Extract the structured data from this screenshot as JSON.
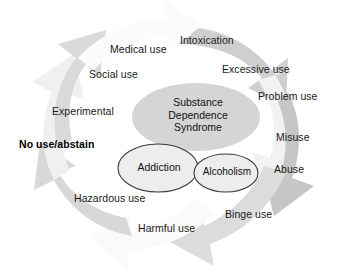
{
  "diagram": {
    "center": {
      "line1": "Substance",
      "line2": "Dependence",
      "line3": "Syndrome"
    },
    "inner_circles": [
      {
        "id": "addiction",
        "label": "Addiction"
      },
      {
        "id": "alcoholism",
        "label": "Alcoholism"
      }
    ],
    "ring_labels": [
      {
        "id": "intoxication",
        "label": "Intoxication",
        "bold": false
      },
      {
        "id": "excessive-use",
        "label": "Excessive use",
        "bold": false
      },
      {
        "id": "problem-use",
        "label": "Problem use",
        "bold": false
      },
      {
        "id": "misuse",
        "label": "Misuse",
        "bold": false
      },
      {
        "id": "abuse",
        "label": "Abuse",
        "bold": false
      },
      {
        "id": "binge-use",
        "label": "Binge use",
        "bold": false
      },
      {
        "id": "harmful-use",
        "label": "Harmful use",
        "bold": false
      },
      {
        "id": "hazardous-use",
        "label": "Hazardous use",
        "bold": false
      },
      {
        "id": "no-use-abstain",
        "label": "No use/abstain",
        "bold": true
      },
      {
        "id": "experimental",
        "label": "Experimental",
        "bold": false
      },
      {
        "id": "social-use",
        "label": "Social use",
        "bold": false
      },
      {
        "id": "medical-use",
        "label": "Medical use",
        "bold": false
      }
    ],
    "colors": {
      "background": "#ffffff",
      "arrow_light": "#f4f4f4",
      "arrow_mid": "#e2e2e2",
      "arrow_dark": "#cfcfcf",
      "arrow_darker": "#c0c0c0",
      "center_ellipse": "#d6d6d6",
      "inner_ellipse": "#ededed",
      "outline": "#3a3a3a",
      "text": "#1a1a1a"
    }
  }
}
